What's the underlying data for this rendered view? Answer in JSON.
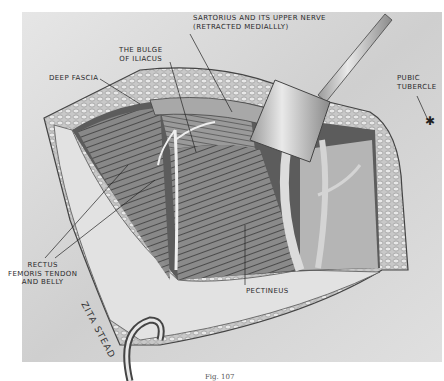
{
  "figure": {
    "type": "surgical anatomy illustration",
    "caption": "Fig. 107",
    "artist_signature": "ZITA STEAD",
    "colors": {
      "background": "#d9d9d9",
      "skin": "#e4e4e4",
      "muscle_dark": "#6a6a6a",
      "fat_edge": "#bdbdbd",
      "ink": "#2a2a2a"
    }
  },
  "labels": {
    "sartorius": "SARTORIUS AND ITS UPPER NERVE",
    "sartorius_line2": "(RETRACTED MEDIALLLY)",
    "bulge_line1": "THE BULGE",
    "bulge_line2": "OF ILIACUS",
    "deep_fascia": "DEEP FASCIA",
    "pubic_line1": "PUBIC",
    "pubic_line2": "TUBERCLE",
    "rectus_line1": "RECTUS",
    "rectus_line2": "FEMORIS TENDON",
    "rectus_line3": "AND BELLY",
    "pectineus": "PECTINEUS"
  }
}
